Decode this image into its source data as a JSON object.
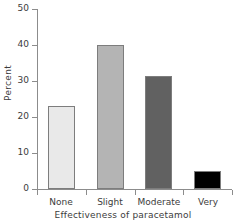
{
  "chart_data": {
    "type": "bar",
    "title": "",
    "xlabel": "Effectiveness of paracetamol",
    "ylabel": "Percent",
    "categories": [
      "None",
      "Slight",
      "Moderate",
      "Very"
    ],
    "values": [
      23,
      40,
      31.5,
      5
    ],
    "ylim": [
      0,
      50
    ],
    "yticks": [
      0,
      10,
      20,
      30,
      40,
      50
    ],
    "ytick_labels": [
      "0",
      "10",
      "20",
      "30",
      "40",
      "50"
    ],
    "grid": false,
    "legend": "none",
    "bar_colors": [
      "#e9e9e9",
      "#b4b4b4",
      "#616161",
      "#000000"
    ],
    "bar_edge_color": "#7d7d7d",
    "axis_color": "#8c8c8c",
    "text_color": "#3c3c3c",
    "background": "#ffffff"
  }
}
